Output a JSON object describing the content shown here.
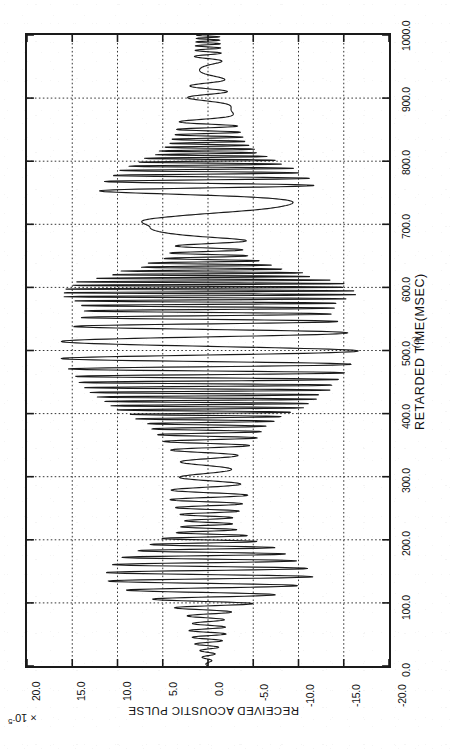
{
  "figure": {
    "subfigure_label": "(a)",
    "background_color": "#ffffff",
    "line_color": "#1a1a1a",
    "grid_color": "#333333"
  },
  "chart_data": {
    "type": "line",
    "title": "",
    "orientation": "rotated-90-ccw",
    "xlabel": "RECEIVED ACOUSTIC PULSE",
    "x_unit_multiplier": "× 10",
    "x_unit_exponent": "-5",
    "ylabel": "RETARDED TIME(MSEC)",
    "xlim": [
      -20.0,
      20.0
    ],
    "ylim": [
      0.0,
      1000.0
    ],
    "grid": true,
    "legend": "none",
    "x_ticks": [
      "20.0",
      "15.0",
      "10.0",
      "5.0",
      "0.0",
      "-5.0",
      "-10.0",
      "-15.0",
      "-20.0"
    ],
    "x_tick_values": [
      20.0,
      15.0,
      10.0,
      5.0,
      0.0,
      -5.0,
      -10.0,
      -15.0,
      -20.0
    ],
    "y_ticks": [
      "0.0",
      "100.0",
      "200.0",
      "300.0",
      "400.0",
      "500.0",
      "600.0",
      "700.0",
      "800.0",
      "900.0",
      "1000.0"
    ],
    "y_tick_values": [
      0.0,
      100.0,
      200.0,
      300.0,
      400.0,
      500.0,
      600.0,
      700.0,
      800.0,
      900.0,
      1000.0
    ],
    "series": [
      {
        "name": "received acoustic pulse",
        "description": "Oscillatory acoustic pulse train versus retarded time; amplitude in units of 1e-5.",
        "carrier_period_msec": 11.6,
        "envelope_t": [
          0,
          20,
          40,
          55,
          70,
          85,
          100,
          112,
          125,
          140,
          155,
          170,
          185,
          200,
          215,
          230,
          250,
          270,
          290,
          310,
          330,
          350,
          365,
          380,
          395,
          410,
          425,
          440,
          455,
          470,
          485,
          500,
          515,
          530,
          545,
          560,
          575,
          590,
          605,
          620,
          635,
          650,
          665,
          680,
          695,
          710,
          725,
          740,
          755,
          770,
          785,
          800,
          815,
          830,
          845,
          860,
          875,
          890,
          905,
          920,
          935,
          950,
          965,
          980,
          1000
        ],
        "envelope_a": [
          0.2,
          0.8,
          1.6,
          2.1,
          1.7,
          2.6,
          5.0,
          7.4,
          9.8,
          11.6,
          11.0,
          9.6,
          7.6,
          5.2,
          3.2,
          2.6,
          3.6,
          4.4,
          3.6,
          2.6,
          3.2,
          4.6,
          5.6,
          6.4,
          8.2,
          10.6,
          12.2,
          13.6,
          14.6,
          15.4,
          16.2,
          16.6,
          16.2,
          15.4,
          14.4,
          13.6,
          14.4,
          16.4,
          15.2,
          11.0,
          7.0,
          4.4,
          3.6,
          4.6,
          6.4,
          8.6,
          10.4,
          11.6,
          12.0,
          11.4,
          9.8,
          7.6,
          5.4,
          4.2,
          3.6,
          3.2,
          2.8,
          2.5,
          2.2,
          2.0,
          1.8,
          1.6,
          1.5,
          1.4,
          1.3
        ],
        "peak_amplitude": 16.6,
        "peak_time_msec": 500.0
      }
    ],
    "annotations": []
  }
}
